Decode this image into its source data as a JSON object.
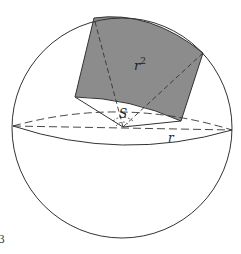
{
  "diagram": {
    "type": "sphere-steradian",
    "labels": {
      "area": "r",
      "area_exponent": "2",
      "solid_angle": "S",
      "radius": "r",
      "figure_fragment": "3"
    },
    "colors": {
      "stroke": "#333333",
      "shaded_region": "#8c8c8c",
      "background": "#ffffff"
    }
  }
}
